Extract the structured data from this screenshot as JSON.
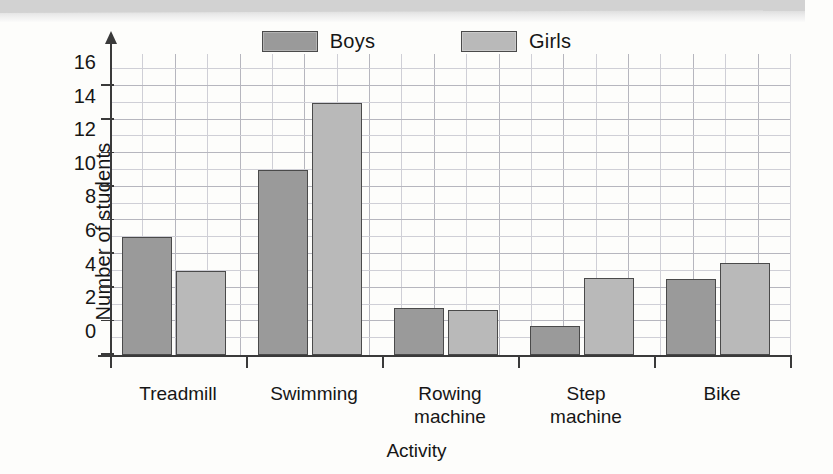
{
  "figure": {
    "y_axis_title": "Number of students",
    "x_axis_title": "Activity"
  },
  "legend": {
    "position": "top-center",
    "items": [
      {
        "label": "Boys",
        "color": "#9a9a9a",
        "swatch_name": "legend-swatch-boys"
      },
      {
        "label": "Girls",
        "color": "#b9b9b9",
        "swatch_name": "legend-swatch-girls"
      }
    ]
  },
  "axis": {
    "y_ticks": [
      "0",
      "2",
      "4",
      "6",
      "8",
      "10",
      "12",
      "14",
      "16"
    ],
    "y_tick_values": [
      0,
      2,
      4,
      6,
      8,
      10,
      12,
      14,
      16
    ],
    "y_min": 0,
    "y_max": 17.3
  },
  "chart_data": {
    "type": "bar",
    "title": "",
    "subtitle": "",
    "xlabel": "Activity",
    "ylabel": "Number of students",
    "categories": [
      "Treadmill",
      "Swimming",
      "Rowing machine",
      "Step machine",
      "Bike"
    ],
    "category_lines": [
      [
        "Treadmill"
      ],
      [
        "Swimming"
      ],
      [
        "Rowing",
        "machine"
      ],
      [
        "Step",
        "machine"
      ],
      [
        "Bike"
      ]
    ],
    "series": [
      {
        "name": "Boys",
        "color": "#9a9a9a",
        "values": [
          7,
          11,
          2.8,
          1.7,
          4.5
        ]
      },
      {
        "name": "Girls",
        "color": "#b9b9b9",
        "values": [
          5,
          15,
          2.7,
          4.6,
          5.5
        ]
      }
    ],
    "ylim": [
      0,
      17.3
    ],
    "yticks": [
      0,
      2,
      4,
      6,
      8,
      10,
      12,
      14,
      16
    ],
    "grid": true,
    "legend_position": "top-center"
  },
  "colors": {
    "boys": "#9a9a9a",
    "girls": "#b9b9b9",
    "bar_outline": "#4a4a4a",
    "axis": "#3a3a3a",
    "grid": "#b6b6be",
    "page": "#fdfdfb",
    "text": "#161616"
  }
}
